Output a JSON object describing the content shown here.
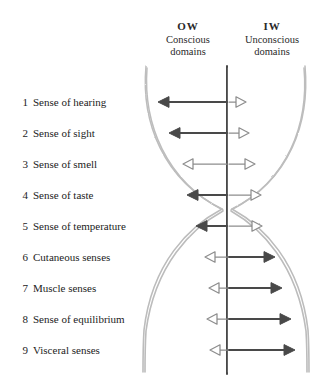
{
  "columns": [
    {
      "abbr": "OW",
      "line1": "Conscious",
      "line2": "domains"
    },
    {
      "abbr": "IW",
      "line1": "Unconscious",
      "line2": "domains"
    }
  ],
  "senses": [
    {
      "num": "1",
      "label": "Sense of hearing"
    },
    {
      "num": "2",
      "label": "Sense of sight"
    },
    {
      "num": "3",
      "label": "Sense of smell"
    },
    {
      "num": "4",
      "label": "Sense of taste"
    },
    {
      "num": "5",
      "label": "Sense of temperature"
    },
    {
      "num": "6",
      "label": "Cutaneous senses"
    },
    {
      "num": "7",
      "label": "Muscle senses"
    },
    {
      "num": "8",
      "label": "Sense of equilibrium"
    },
    {
      "num": "9",
      "label": "Visceral senses"
    }
  ],
  "chart_data": {
    "type": "diagram",
    "title": "",
    "axis_x": 227,
    "legend": [
      "OW Conscious domains",
      "IW Unconscious domains"
    ],
    "categories": [
      "Sense of hearing",
      "Sense of sight",
      "Sense of smell",
      "Sense of taste",
      "Sense of temperature",
      "Cutaneous senses",
      "Muscle senses",
      "Sense of equilibrium",
      "Visceral senses"
    ],
    "series": [
      {
        "name": "OW (left, conscious) magnitude",
        "values": [
          69,
          58,
          44,
          40,
          31,
          22,
          18,
          20,
          17
        ]
      },
      {
        "name": "IW (right, unconscious) magnitude",
        "values": [
          17,
          20,
          26,
          32,
          33,
          46,
          53,
          62,
          66
        ]
      }
    ],
    "left_arrow_filled": [
      true,
      true,
      false,
      true,
      true,
      false,
      false,
      false,
      false
    ],
    "right_arrow_filled": [
      false,
      false,
      false,
      false,
      false,
      true,
      true,
      true,
      true
    ]
  },
  "colors": {
    "ink": "#1a1a1a",
    "arrow_dark": "#4a4a4a",
    "arrow_light": "#8d8d8d",
    "curve": "#b9b9b9",
    "axis": "#3c3c3c",
    "background": "#ffffff"
  }
}
